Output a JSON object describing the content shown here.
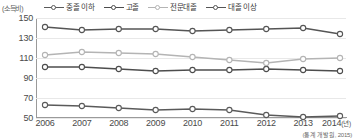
{
  "chart_data": {
    "type": "line",
    "title": "",
    "subtitle": "",
    "xlabel": "년",
    "ylabel": "(소득비)",
    "y_unit_caption": "(소득비)",
    "x_unit_caption": "(년)",
    "categories": [
      "2006",
      "2007",
      "2008",
      "2009",
      "2010",
      "2011",
      "2012",
      "2013",
      "2014"
    ],
    "x": [
      2006,
      2007,
      2008,
      2009,
      2010,
      2011,
      2012,
      2013,
      2014
    ],
    "yticks": [
      50,
      70,
      90,
      110,
      130,
      150
    ],
    "ylim": [
      50,
      150
    ],
    "grid": true,
    "legend_position": "top",
    "source": "(통계 개발원, 2015)",
    "series": [
      {
        "name": "중졸 이하",
        "color": "#5a5a5a",
        "values": [
          63,
          62,
          60,
          58,
          59,
          58,
          53,
          51,
          52
        ]
      },
      {
        "name": "고졸",
        "color": "#4d4d4d",
        "values": [
          101,
          101,
          99,
          97,
          98,
          98,
          99,
          98,
          97
        ]
      },
      {
        "name": "전문대졸",
        "color": "#b4b4b4",
        "values": [
          113,
          116,
          115,
          114,
          111,
          108,
          105,
          109,
          110
        ]
      },
      {
        "name": "대졸 이상",
        "color": "#555555",
        "values": [
          141,
          138,
          139,
          139,
          137,
          138,
          139,
          140,
          134
        ]
      }
    ]
  }
}
